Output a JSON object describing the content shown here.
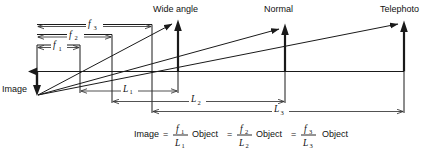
{
  "labels": {
    "image": "Image",
    "wide_angle": "Wide angle",
    "normal": "Normal",
    "telephoto": "Telephoto"
  },
  "dimensions": {
    "f1": {
      "symbol": "f",
      "subscript": "1"
    },
    "f2": {
      "symbol": "f",
      "subscript": "2"
    },
    "f3": {
      "symbol": "f",
      "subscript": "3"
    },
    "L1": {
      "symbol": "L",
      "subscript": "1"
    },
    "L2": {
      "symbol": "L",
      "subscript": "2"
    },
    "L3": {
      "symbol": "L",
      "subscript": "3"
    }
  },
  "equation": {
    "image_word": "Image",
    "equals_1": "=",
    "num_1": "f",
    "num_1_sub": "1",
    "den_1": "L",
    "den_1_sub": "1",
    "object_1": "Object",
    "equals_2": "=",
    "num_2": "f",
    "num_2_sub": "2",
    "den_2": "L",
    "den_2_sub": "2",
    "object_2": "Object",
    "equals_3": "=",
    "num_3": "f",
    "num_3_sub": "3",
    "den_3": "L",
    "den_3_sub": "3",
    "object_3": "Object"
  },
  "colors": {
    "ink": "#1a1a1a",
    "dim": "#333333",
    "background": "#ffffff"
  }
}
